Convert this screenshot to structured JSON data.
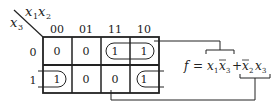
{
  "kmap": {
    "row_var": "x3",
    "col_var": "x1x2",
    "col_var_parts": [
      "x",
      "1",
      "x",
      "2"
    ],
    "row_var_parts": [
      "x",
      "3"
    ],
    "col_labels": [
      "00",
      "01",
      "11",
      "10"
    ],
    "row_labels": [
      "0",
      "1"
    ],
    "cells": [
      [
        "0",
        "0",
        "1",
        "1"
      ],
      [
        "1",
        "0",
        "0",
        "1"
      ]
    ],
    "groups": [
      {
        "name": "group-x1-x3bar",
        "row": 0,
        "cols": [
          2,
          3
        ],
        "term": "x1 x3bar"
      },
      {
        "name": "group-x2bar-x3",
        "row": 1,
        "cols": [
          0,
          3
        ],
        "wraparound": true,
        "term": "x2bar x3"
      }
    ]
  },
  "equation": {
    "lhs": "f",
    "eq": "=",
    "plus": "+",
    "full": "f = x1 x̄3 + x̄2 x3"
  },
  "colors": {
    "line": "#222222",
    "background": "#ffffff"
  }
}
